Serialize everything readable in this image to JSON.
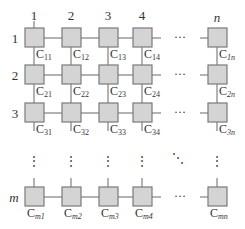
{
  "diagram": {
    "type": "array-grid",
    "colors": {
      "cell_fill": "#d4d4d4",
      "cell_border": "#7a7a7a",
      "line": "#808080",
      "text": "#333333"
    },
    "column_headers": [
      "1",
      "2",
      "3",
      "4",
      "n"
    ],
    "row_headers": [
      "1",
      "2",
      "3",
      "m"
    ],
    "ellipsis_horizontal": "···",
    "ellipsis_vertical": "⋮",
    "ellipsis_diagonal": "⋱",
    "cells": [
      [
        {
          "base": "C",
          "sub": "11"
        },
        {
          "base": "C",
          "sub": "12"
        },
        {
          "base": "C",
          "sub": "13"
        },
        {
          "base": "C",
          "sub": "14"
        },
        {
          "base": "C",
          "sub": "1n"
        }
      ],
      [
        {
          "base": "C",
          "sub": "21"
        },
        {
          "base": "C",
          "sub": "22"
        },
        {
          "base": "C",
          "sub": "23"
        },
        {
          "base": "C",
          "sub": "24"
        },
        {
          "base": "C",
          "sub": "2n"
        }
      ],
      [
        {
          "base": "C",
          "sub": "31"
        },
        {
          "base": "C",
          "sub": "32"
        },
        {
          "base": "C",
          "sub": "33"
        },
        {
          "base": "C",
          "sub": "34"
        },
        {
          "base": "C",
          "sub": "3n"
        }
      ],
      [
        {
          "base": "C",
          "sub": "m1"
        },
        {
          "base": "C",
          "sub": "m2"
        },
        {
          "base": "C",
          "sub": "m3"
        },
        {
          "base": "C",
          "sub": "m4"
        },
        {
          "base": "C",
          "sub": "mn"
        }
      ]
    ]
  }
}
